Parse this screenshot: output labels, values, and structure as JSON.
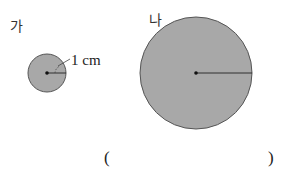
{
  "figures": {
    "left": {
      "label": "가",
      "radius_label": "1 cm"
    },
    "right": {
      "label": "나"
    }
  },
  "answer": {
    "open": "(",
    "close": ")",
    "value": ""
  },
  "colors": {
    "circle_fill": "#a8a8a8",
    "circle_stroke": "#555555"
  }
}
